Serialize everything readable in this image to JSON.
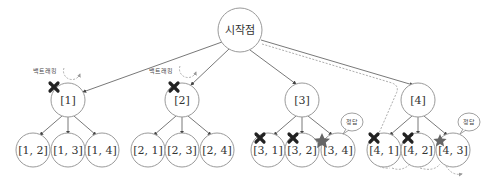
{
  "diagram": {
    "type": "backtracking-tree",
    "root": {
      "label": "시작점"
    },
    "level1": [
      {
        "label": "[1]",
        "mark": "x",
        "annotation": "백트래킹"
      },
      {
        "label": "[2]",
        "mark": "x",
        "annotation": "백트래킹"
      },
      {
        "label": "[3]",
        "mark": "",
        "annotation": ""
      },
      {
        "label": "[4]",
        "mark": "",
        "annotation": ""
      }
    ],
    "level2": [
      {
        "label": "[1, 2]",
        "mark": ""
      },
      {
        "label": "[1, 3]",
        "mark": ""
      },
      {
        "label": "[1, 4]",
        "mark": ""
      },
      {
        "label": "[2, 1]",
        "mark": ""
      },
      {
        "label": "[2, 3]",
        "mark": ""
      },
      {
        "label": "[2, 4]",
        "mark": ""
      },
      {
        "label": "[3, 1]",
        "mark": "x"
      },
      {
        "label": "[3, 2]",
        "mark": "x"
      },
      {
        "label": "[3, 4]",
        "mark": "star",
        "bubble": "정답"
      },
      {
        "label": "[4, 1]",
        "mark": "x"
      },
      {
        "label": "[4, 2]",
        "mark": "x"
      },
      {
        "label": "[4, 3]",
        "mark": "star",
        "bubble": "정답"
      }
    ],
    "colors": {
      "node_stroke": "#9a9a9a",
      "edge": "#555555",
      "x_mark": "#222222",
      "star": "#666666",
      "dashed": "#999999"
    }
  }
}
